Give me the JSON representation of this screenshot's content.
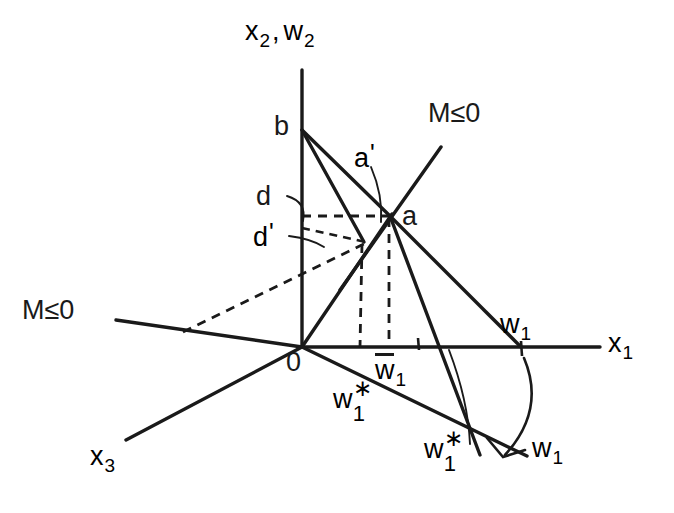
{
  "figure": {
    "type": "geometric-diagram",
    "background_color": "#ffffff",
    "ink_color": "#1a1a1a"
  },
  "axes": {
    "vertical": {
      "label_x": "x",
      "label_x_sub": "2",
      "separator": ",",
      "label_w": "w",
      "label_w_sub": "2"
    },
    "horizontal": {
      "label": "x",
      "sub": "1"
    },
    "depth": {
      "label": "x",
      "sub": "3"
    },
    "origin": {
      "label": "0"
    }
  },
  "points": {
    "b": "b",
    "a": "a",
    "a_prime_base": "a",
    "a_prime_mark": "'",
    "d": "d",
    "d_prime_base": "d",
    "d_prime_mark": "'"
  },
  "constraints": {
    "upper_right": "M≤0",
    "left": "M≤0"
  },
  "wage_labels": {
    "w1_axis": {
      "base": "w",
      "sub": "1"
    },
    "w1_bar": {
      "base": "w",
      "sub": "1",
      "overbar": true
    },
    "w1_star_left": {
      "base": "w",
      "sup": "∗",
      "sub": "1"
    },
    "w1_star_lower": {
      "base": "w",
      "sup": "∗",
      "sub": "1"
    },
    "w1_lower_right": {
      "base": "w",
      "sub": "1"
    }
  }
}
